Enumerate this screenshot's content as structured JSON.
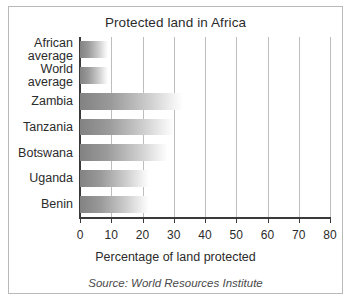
{
  "chart_data": {
    "type": "bar",
    "orientation": "horizontal",
    "title": "Protected land in Africa",
    "xlabel": "Percentage of land protected",
    "ylabel": "",
    "xlim": [
      0,
      80
    ],
    "xticks": [
      0,
      10,
      20,
      30,
      40,
      50,
      60,
      70,
      80
    ],
    "xtick_labels": [
      "0",
      "10",
      "20",
      "30",
      "40",
      "50",
      "60",
      "70",
      "80"
    ],
    "grid": "vertical",
    "legend": "none",
    "categories": [
      "African\naverage",
      "World\naverage",
      "Zambia",
      "Tanzania",
      "Botswana",
      "Uganda",
      "Benin"
    ],
    "values": [
      9,
      9,
      33,
      30,
      28,
      22,
      22
    ],
    "annotations": [
      "Source: World Resources Institute"
    ],
    "bar_fill": "gradient grey to white, left to right",
    "colors": {
      "bar_dark": "#828282",
      "bar_light": "#ffffff",
      "axis": "#3a3a3a",
      "grid": "#bdbdbd",
      "text": "#2b2b2b",
      "border": "#b9b9b9",
      "background": "#ffffff"
    }
  },
  "source_note": "Source: World Resources Institute"
}
